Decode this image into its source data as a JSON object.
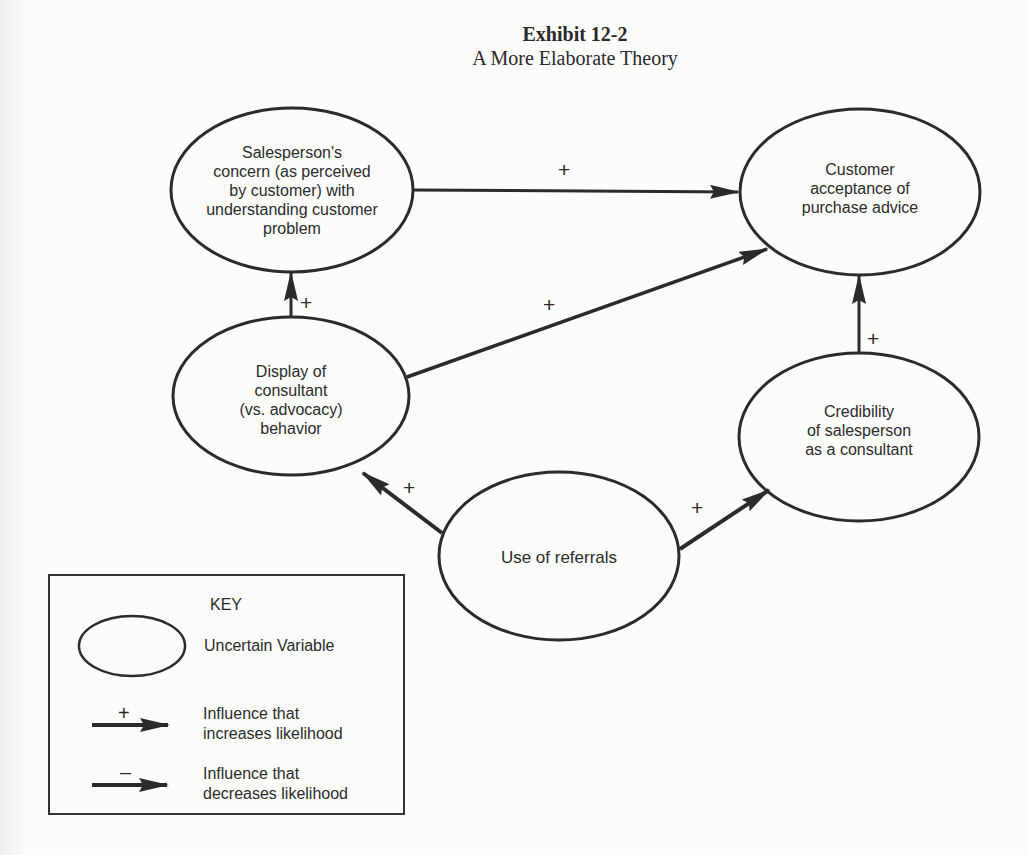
{
  "title": {
    "exhibit": "Exhibit 12-2",
    "subtitle": "A More Elaborate Theory"
  },
  "nodes": [
    {
      "id": "salesperson-concern",
      "label": "Salesperson's concern (as perceived by customer) with understanding customer problem",
      "lines": [
        "Salesperson's",
        "concern (as perceived",
        "by customer) with",
        "understanding customer",
        "problem"
      ]
    },
    {
      "id": "customer-acceptance",
      "label": "Customer acceptance of purchase advice",
      "lines": [
        "Customer",
        "acceptance of",
        "purchase advice"
      ]
    },
    {
      "id": "display-consultant",
      "label": "Display of consultant (vs. advocacy) behavior",
      "lines": [
        "Display of",
        "consultant",
        "(vs. advocacy)",
        "behavior"
      ]
    },
    {
      "id": "credibility",
      "label": "Credibility of salesperson as a consultant",
      "lines": [
        "Credibility",
        "of salesperson",
        "as a consultant"
      ]
    },
    {
      "id": "referrals",
      "label": "Use of referrals",
      "lines": [
        "Use of referrals"
      ]
    }
  ],
  "edges": [
    {
      "from": "salesperson-concern",
      "to": "customer-acceptance",
      "sign": "+"
    },
    {
      "from": "display-consultant",
      "to": "customer-acceptance",
      "sign": "+"
    },
    {
      "from": "display-consultant",
      "to": "salesperson-concern",
      "sign": "+"
    },
    {
      "from": "credibility",
      "to": "customer-acceptance",
      "sign": "+"
    },
    {
      "from": "referrals",
      "to": "display-consultant",
      "sign": "+"
    },
    {
      "from": "referrals",
      "to": "credibility",
      "sign": "+"
    }
  ],
  "key": {
    "title": "KEY",
    "items": [
      {
        "symbol": "ellipse",
        "label": "Uncertain Variable"
      },
      {
        "symbol": "arrow-plus",
        "sign": "+",
        "lines": [
          "Influence that",
          "increases likelihood"
        ]
      },
      {
        "symbol": "arrow-minus",
        "sign": "–",
        "lines": [
          "Influence that",
          "decreases likelihood"
        ]
      }
    ]
  },
  "colors": {
    "ink": "#2b2b2b",
    "paper": "#fcfcfb"
  }
}
